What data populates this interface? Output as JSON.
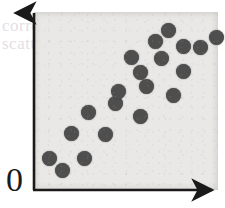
{
  "figure": {
    "name": "scatter-plot",
    "origin_label": "0",
    "background_color": "#e9e8e6",
    "point_color": "#4e4e4e",
    "axis_color": "#1a1a1a"
  },
  "ghost_text": {
    "line_1": "correlation",
    "line_2": "scatter",
    "line_3": "positive",
    "line_4": "relationship"
  },
  "chart_data": {
    "type": "scatter",
    "title": "",
    "subtitle": "",
    "xlabel": "",
    "ylabel": "",
    "xlim": [
      0,
      100
    ],
    "ylim": [
      0,
      100
    ],
    "grid": false,
    "legend": "none",
    "axis_style": "arrow",
    "origin_label": "0",
    "n_points": 20,
    "annotation": "Positive linear association between x and y",
    "series": [
      {
        "name": "observations",
        "marker": "circle",
        "color": "#4e4e4e",
        "points": [
          {
            "x": 8,
            "y": 18
          },
          {
            "x": 16,
            "y": 11
          },
          {
            "x": 27,
            "y": 18
          },
          {
            "x": 20,
            "y": 33
          },
          {
            "x": 39,
            "y": 32
          },
          {
            "x": 30,
            "y": 46
          },
          {
            "x": 44,
            "y": 51
          },
          {
            "x": 58,
            "y": 44
          },
          {
            "x": 46,
            "y": 65
          },
          {
            "x": 76,
            "y": 62
          },
          {
            "x": 58,
            "y": 73
          },
          {
            "x": 53,
            "y": 82
          },
          {
            "x": 69,
            "y": 81
          },
          {
            "x": 81,
            "y": 73
          },
          {
            "x": 66,
            "y": 91
          },
          {
            "x": 81,
            "y": 88
          },
          {
            "x": 73,
            "y": 97
          },
          {
            "x": 90,
            "y": 87
          },
          {
            "x": 99,
            "y": 94
          },
          {
            "x": 61,
            "y": 58
          }
        ],
        "pixel_points": [
          {
            "cx": 15,
            "cy": 146
          },
          {
            "cx": 28,
            "cy": 158
          },
          {
            "cx": 50,
            "cy": 146
          },
          {
            "cx": 37,
            "cy": 121
          },
          {
            "cx": 71,
            "cy": 122
          },
          {
            "cx": 54,
            "cy": 100
          },
          {
            "cx": 81,
            "cy": 91
          },
          {
            "cx": 106,
            "cy": 104
          },
          {
            "cx": 84,
            "cy": 79
          },
          {
            "cx": 139,
            "cy": 83
          },
          {
            "cx": 106,
            "cy": 60
          },
          {
            "cx": 97,
            "cy": 45
          },
          {
            "cx": 127,
            "cy": 46
          },
          {
            "cx": 149,
            "cy": 59
          },
          {
            "cx": 121,
            "cy": 29
          },
          {
            "cx": 149,
            "cy": 34
          },
          {
            "cx": 134,
            "cy": 18
          },
          {
            "cx": 166,
            "cy": 35
          },
          {
            "cx": 182,
            "cy": 25
          },
          {
            "cx": 112,
            "cy": 74
          }
        ]
      }
    ]
  }
}
